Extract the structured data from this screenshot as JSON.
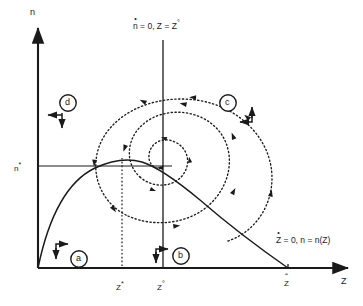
{
  "figure": {
    "type": "phase-plane-diagram",
    "background_color": "#ffffff",
    "stroke_color": "#1a1a1a"
  },
  "axes": {
    "y_label": "n",
    "x_label": "Z",
    "x_origin_px": 38,
    "y_origin_px": 268,
    "x_end_px": 352,
    "y_top_px": 22
  },
  "ticks": {
    "y": [
      {
        "label_main": "n",
        "label_sup": "*",
        "name": "n-star",
        "y_px": 166
      }
    ],
    "x": [
      {
        "label_main": "Z",
        "label_sup": "*",
        "name": "z-star",
        "x_px": 122
      },
      {
        "label_main": "Z",
        "label_sup": "°",
        "name": "z-circ",
        "x_px": 163
      },
      {
        "label_main": "Z",
        "label_accent": "hat",
        "name": "z-hat",
        "x_px": 288
      }
    ]
  },
  "nullclines": [
    {
      "name": "n-dot-nullcline",
      "label_parts": {
        "var": "n",
        "accent": "dot",
        "rest": " = 0, Z = Z",
        "sup": "°"
      },
      "label_text": "ṅ = 0, Z = Z°",
      "orientation": "vertical",
      "at_x_px": 163,
      "label_x_px": 133,
      "label_y_px": 22
    },
    {
      "name": "z-dot-nullcline",
      "label_parts": {
        "var": "Z",
        "accent": "dot",
        "rest": " = 0, n = n(Z)"
      },
      "label_text": "Ż = 0, n = n(Z)",
      "orientation": "hump-curve",
      "label_x_px": 276,
      "label_y_px": 238
    }
  ],
  "regions": [
    {
      "id": "a",
      "label": "a",
      "name": "region-a",
      "cx_px": 79,
      "cy_px": 259,
      "arrow": "up-right"
    },
    {
      "id": "b",
      "label": "b",
      "name": "region-b",
      "cx_px": 181,
      "cy_px": 256,
      "arrow": "up-right"
    },
    {
      "id": "c",
      "label": "c",
      "name": "region-c",
      "cx_px": 228,
      "cy_px": 103,
      "arrow": "down-left"
    },
    {
      "id": "d",
      "label": "d",
      "name": "region-d",
      "cx_px": 68,
      "cy_px": 103,
      "arrow": "left-down"
    }
  ],
  "trajectory": {
    "name": "spiral-trajectory",
    "style": "dotted",
    "direction": "counterclockwise-inward",
    "description": "damped spiral converging on the nullcline intersection"
  },
  "equilibrium": {
    "name": "equilibrium-point",
    "x_px": 163,
    "y_px": 166
  },
  "guides": [
    {
      "name": "z-star-dotted-vertical",
      "x_px": 122,
      "y_from_px": 160,
      "y_to_px": 268
    },
    {
      "name": "n-star-horizontal",
      "y_px": 166,
      "x_from_px": 38,
      "x_to_px": 170
    }
  ]
}
